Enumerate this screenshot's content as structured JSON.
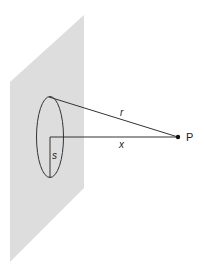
{
  "diagram": {
    "colors": {
      "plane": "#dddddd",
      "stroke": "#333333",
      "point": "#111111"
    },
    "labels": {
      "r": "r",
      "x": "x",
      "s": "s",
      "P": "P"
    }
  }
}
